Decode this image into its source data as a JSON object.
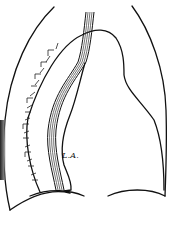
{
  "figure": {
    "type": "anatomical line drawing",
    "labels": [
      {
        "id": "left-atrium",
        "text": "L.A."
      }
    ],
    "caption_fragment": "...",
    "colors": {
      "line": "#111111",
      "background": "#ffffff",
      "hatching": "#555555"
    }
  }
}
